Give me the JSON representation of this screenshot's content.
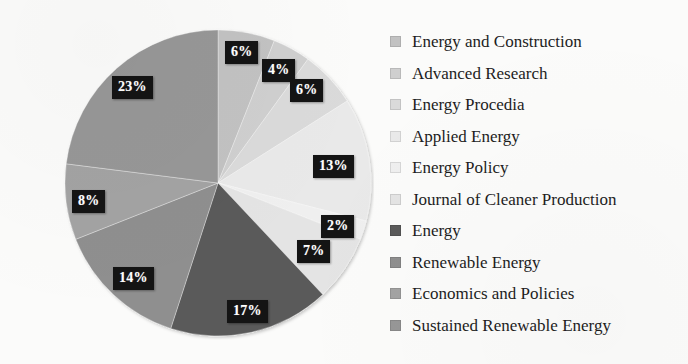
{
  "chart_data": {
    "type": "pie",
    "title": "",
    "legend_position": "right",
    "labels": [
      "Energy and Construction",
      "Advanced Research",
      "Energy Procedia",
      "Applied Energy",
      "Energy Policy",
      "Journal of Cleaner Production",
      "Energy",
      "Renewable Energy",
      "Economics and Policies",
      "Sustained Renewable Energy"
    ],
    "values": [
      6,
      4,
      6,
      13,
      2,
      7,
      17,
      14,
      8,
      23
    ],
    "value_labels": [
      "6%",
      "4%",
      "6%",
      "13%",
      "2%",
      "7%",
      "17%",
      "14%",
      "8%",
      "23%"
    ],
    "colors": [
      "#c2c2c2",
      "#cfcfcf",
      "#dadada",
      "#e9e9e9",
      "#efefef",
      "#e4e4e4",
      "#5a5a5a",
      "#8f8f8f",
      "#a3a3a3",
      "#979797"
    ],
    "label_text_color": "#ffffff",
    "label_box_color": "#141414",
    "background_color": "#fbfbfa",
    "total": 100,
    "units": "percent"
  },
  "legend": {
    "items": [
      {
        "label": "Energy and Construction",
        "color": "#c2c2c2",
        "value": "6%"
      },
      {
        "label": "Advanced Research",
        "color": "#cfcfcf",
        "value": "4%"
      },
      {
        "label": "Energy Procedia",
        "color": "#dadada",
        "value": "6%"
      },
      {
        "label": "Applied Energy",
        "color": "#e9e9e9",
        "value": "13%"
      },
      {
        "label": "Energy Policy",
        "color": "#efefef",
        "value": "2%"
      },
      {
        "label": "Journal of Cleaner Production",
        "color": "#e4e4e4",
        "value": "7%"
      },
      {
        "label": "Energy",
        "color": "#5a5a5a",
        "value": "17%"
      },
      {
        "label": "Renewable Energy",
        "color": "#8f8f8f",
        "value": "14%"
      },
      {
        "label": "Economics and Policies",
        "color": "#a3a3a3",
        "value": "8%"
      },
      {
        "label": "Sustained Renewable Energy",
        "color": "#979797",
        "value": "23%"
      }
    ]
  },
  "callouts": [
    {
      "text": "6%",
      "left": 225,
      "top": 41
    },
    {
      "text": "4%",
      "left": 262,
      "top": 59
    },
    {
      "text": "6%",
      "left": 290,
      "top": 79
    },
    {
      "text": "13%",
      "left": 313,
      "top": 155
    },
    {
      "text": "2%",
      "left": 321,
      "top": 215
    },
    {
      "text": "7%",
      "left": 297,
      "top": 240
    },
    {
      "text": "17%",
      "left": 227,
      "top": 300
    },
    {
      "text": "14%",
      "left": 113,
      "top": 267
    },
    {
      "text": "8%",
      "left": 72,
      "top": 190
    },
    {
      "text": "23%",
      "left": 112,
      "top": 76
    }
  ]
}
